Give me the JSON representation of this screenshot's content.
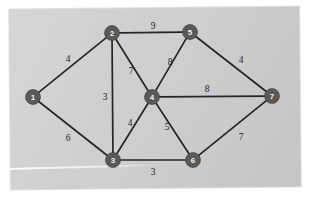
{
  "figure": {
    "kind": "weighted-undirected-graph",
    "background_color": "#cfcfcf",
    "page_color": "#ffffff",
    "node_color": "#595959",
    "node_text_color": "#f2f2f2",
    "edge_color": "#262626",
    "weight_text_color": "#1f1f1f"
  },
  "chart_data": {
    "type": "diagram",
    "title": "",
    "graph_type": "weighted undirected graph",
    "node_count": 7,
    "edge_count": 11,
    "nodes": [
      {
        "id": "1",
        "label": "1",
        "x": 33,
        "y": 97
      },
      {
        "id": "2",
        "label": "2",
        "x": 112,
        "y": 33
      },
      {
        "id": "3",
        "label": "3",
        "x": 113,
        "y": 160
      },
      {
        "id": "4",
        "label": "4",
        "x": 152,
        "y": 97
      },
      {
        "id": "5",
        "label": "5",
        "x": 190,
        "y": 32
      },
      {
        "id": "6",
        "label": "6",
        "x": 193,
        "y": 160
      },
      {
        "id": "7",
        "label": "7",
        "x": 272,
        "y": 96
      }
    ],
    "edges": [
      {
        "source": "1",
        "target": "2",
        "weight": "4",
        "lx": 68,
        "ly": 59
      },
      {
        "source": "1",
        "target": "3",
        "weight": "6",
        "lx": 68,
        "ly": 138
      },
      {
        "source": "2",
        "target": "5",
        "weight": "9",
        "lx": 153,
        "ly": 26
      },
      {
        "source": "2",
        "target": "3",
        "weight": "3",
        "lx": 105,
        "ly": 97
      },
      {
        "source": "2",
        "target": "4",
        "weight": "7",
        "lx": 131,
        "ly": 71
      },
      {
        "source": "3",
        "target": "4",
        "weight": "4",
        "lx": 130,
        "ly": 123
      },
      {
        "source": "3",
        "target": "6",
        "weight": "3",
        "lx": 153,
        "ly": 172
      },
      {
        "source": "4",
        "target": "5",
        "weight": "8",
        "lx": 170,
        "ly": 62
      },
      {
        "source": "4",
        "target": "6",
        "weight": "5",
        "lx": 167,
        "ly": 127
      },
      {
        "source": "4",
        "target": "7",
        "weight": "8",
        "lx": 207,
        "ly": 89
      },
      {
        "source": "5",
        "target": "7",
        "weight": "4",
        "lx": 241,
        "ly": 60
      },
      {
        "source": "6",
        "target": "7",
        "weight": "7",
        "lx": 241,
        "ly": 137
      }
    ],
    "node_radius": 7.5,
    "xlabel": "",
    "ylabel": "",
    "grid": false,
    "legend": false
  }
}
